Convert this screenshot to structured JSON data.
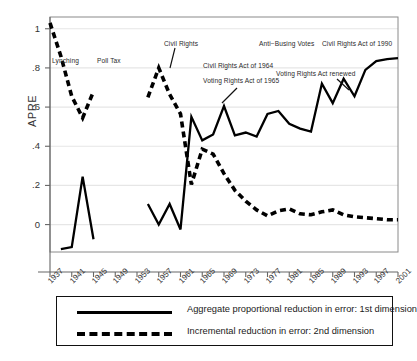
{
  "chart_data": {
    "type": "line",
    "title": "",
    "xlabel": "",
    "ylabel": "APRE",
    "xlim": [
      1937,
      2001
    ],
    "ylim": [
      -0.14,
      1.06
    ],
    "grid": true,
    "grid_axis": "y",
    "yticks": [
      "0",
      ".2",
      ".4",
      ".6",
      ".8",
      "1"
    ],
    "ytick_values": [
      0,
      0.2,
      0.4,
      0.6,
      0.8,
      1.0
    ],
    "xticks": [
      "1937",
      "1941",
      "1945",
      "1949",
      "1953",
      "1957",
      "1961",
      "1965",
      "1969",
      "1973",
      "1977",
      "1981",
      "1985",
      "1989",
      "1993",
      "1997",
      "2001"
    ],
    "xtick_values": [
      1937,
      1941,
      1945,
      1949,
      1953,
      1957,
      1961,
      1965,
      1969,
      1973,
      1977,
      1981,
      1985,
      1989,
      1993,
      1997,
      2001
    ],
    "legend_position": "below-plot",
    "series": [
      {
        "name": "Aggregate proportional reduction in error: 1st dimension",
        "style": "solid",
        "color": "#000000",
        "segments": [
          {
            "x": [
              1939,
              1941,
              1943,
              1945
            ],
            "y": [
              -0.125,
              -0.115,
              0.245,
              -0.075
            ]
          },
          {
            "x": [
              1955,
              1957,
              1959,
              1961,
              1963,
              1965,
              1967,
              1969,
              1971,
              1973,
              1975,
              1977,
              1979,
              1981,
              1983,
              1985,
              1987,
              1989,
              1991,
              1993,
              1995,
              1997,
              1999,
              2001
            ],
            "y": [
              0.105,
              0.0,
              0.105,
              -0.025,
              0.55,
              0.43,
              0.46,
              0.605,
              0.455,
              0.47,
              0.45,
              0.565,
              0.58,
              0.515,
              0.49,
              0.475,
              0.72,
              0.62,
              0.745,
              0.655,
              0.79,
              0.835,
              0.845,
              0.85
            ]
          }
        ]
      },
      {
        "name": "Incremental reduction in error: 2nd dimension",
        "style": "dashed",
        "color": "#000000",
        "segments": [
          {
            "x": [
              1937,
              1939,
              1941,
              1943,
              1945
            ],
            "y": [
              1.03,
              0.86,
              0.655,
              0.545,
              0.68
            ]
          },
          {
            "x": [
              1955,
              1957,
              1959,
              1961,
              1963,
              1965,
              1967,
              1969,
              1971,
              1973,
              1975,
              1977,
              1979,
              1981,
              1983,
              1985,
              1987,
              1989,
              1991,
              1993,
              1995,
              1997,
              1999,
              2001
            ],
            "y": [
              0.65,
              0.8,
              0.665,
              0.565,
              0.205,
              0.385,
              0.36,
              0.26,
              0.175,
              0.12,
              0.075,
              0.045,
              0.07,
              0.08,
              0.055,
              0.05,
              0.065,
              0.075,
              0.05,
              0.04,
              0.035,
              0.03,
              0.025,
              0.025
            ]
          }
        ]
      }
    ],
    "annotations": [
      {
        "text": "Lynching",
        "x": 52,
        "y": 57
      },
      {
        "text": "Poll Tax",
        "x": 97,
        "y": 57
      },
      {
        "text": "Civil Rights",
        "x": 164,
        "y": 40
      },
      {
        "text": "Civil Rights Act of 1964",
        "x": 203,
        "y": 62
      },
      {
        "text": "Voting Rights Act of 1965",
        "x": 203,
        "y": 77
      },
      {
        "text": "Anti−Busing Votes",
        "x": 259,
        "y": 40
      },
      {
        "text": "Voting Rights Act renewed",
        "x": 276,
        "y": 70
      },
      {
        "text": "Civil Rights Act of 1990",
        "x": 322,
        "y": 40
      }
    ]
  },
  "legend": {
    "items": [
      {
        "label": "Aggregate proportional reduction in error: 1st dimension",
        "style": "solid"
      },
      {
        "label": "Incremental reduction in error: 2nd dimension",
        "style": "dashed"
      }
    ]
  }
}
